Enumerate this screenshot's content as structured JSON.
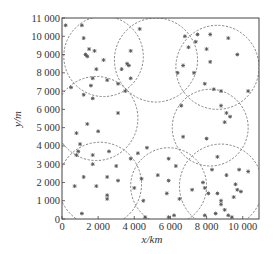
{
  "chart_data": {
    "type": "scatter",
    "title": "",
    "xlabel": "x/km",
    "ylabel": "y/m",
    "xlim": [
      0,
      10900
    ],
    "ylim": [
      0,
      11000
    ],
    "grid": false,
    "legend": null,
    "x_ticks": [
      0,
      2000,
      4000,
      6000,
      8000,
      10000
    ],
    "x_tick_labels": [
      "0",
      "2 000",
      "4 000",
      "6 000",
      "8 000",
      "10 000"
    ],
    "y_ticks": [
      0,
      1000,
      2000,
      3000,
      4000,
      5000,
      6000,
      7000,
      8000,
      9000,
      10000,
      11000
    ],
    "y_tick_labels": [
      "0",
      "1 000",
      "2 000",
      "3 000",
      "4 000",
      "5 000",
      "6 000",
      "7 000",
      "8 000",
      "9 000",
      "10 000",
      "11 000"
    ],
    "marker": "*",
    "marker_color": "#555555",
    "circle_style": "dashed",
    "circle_color": "#777777",
    "circles": [
      {
        "cx": 2300,
        "cy": 8900,
        "r": 2200
      },
      {
        "cx": 5200,
        "cy": 8700,
        "r": 2300
      },
      {
        "cx": 8600,
        "cy": 8300,
        "r": 2300
      },
      {
        "cx": 1900,
        "cy": 5500,
        "r": 2300
      },
      {
        "cx": 8200,
        "cy": 5000,
        "r": 2100
      },
      {
        "cx": 2100,
        "cy": 1900,
        "r": 2300
      },
      {
        "cx": 5900,
        "cy": 1800,
        "r": 2100
      },
      {
        "cx": 8800,
        "cy": 1800,
        "r": 2300
      }
    ],
    "points": [
      {
        "x": 200,
        "y": 10600
      },
      {
        "x": 1100,
        "y": 10600
      },
      {
        "x": 1200,
        "y": 9900
      },
      {
        "x": 1500,
        "y": 9300
      },
      {
        "x": 1300,
        "y": 9000
      },
      {
        "x": 1400,
        "y": 8900
      },
      {
        "x": 1800,
        "y": 9200
      },
      {
        "x": 2300,
        "y": 8700
      },
      {
        "x": 1900,
        "y": 8200
      },
      {
        "x": 1700,
        "y": 7700
      },
      {
        "x": 2500,
        "y": 7600
      },
      {
        "x": 1600,
        "y": 7300
      },
      {
        "x": 500,
        "y": 7200
      },
      {
        "x": 1200,
        "y": 6800
      },
      {
        "x": 1700,
        "y": 6600
      },
      {
        "x": 4300,
        "y": 10400
      },
      {
        "x": 3800,
        "y": 9200
      },
      {
        "x": 3600,
        "y": 8500
      },
      {
        "x": 3700,
        "y": 8400
      },
      {
        "x": 3300,
        "y": 8200
      },
      {
        "x": 3800,
        "y": 7700
      },
      {
        "x": 3100,
        "y": 7400
      },
      {
        "x": 3500,
        "y": 7000
      },
      {
        "x": 6400,
        "y": 8000
      },
      {
        "x": 6700,
        "y": 8400
      },
      {
        "x": 6800,
        "y": 10000
      },
      {
        "x": 7000,
        "y": 9400
      },
      {
        "x": 7400,
        "y": 9700
      },
      {
        "x": 7500,
        "y": 10100
      },
      {
        "x": 8000,
        "y": 9300
      },
      {
        "x": 8200,
        "y": 8600
      },
      {
        "x": 7300,
        "y": 8000
      },
      {
        "x": 7900,
        "y": 7400
      },
      {
        "x": 8400,
        "y": 7100
      },
      {
        "x": 8800,
        "y": 7000
      },
      {
        "x": 8200,
        "y": 10100
      },
      {
        "x": 9200,
        "y": 9900
      },
      {
        "x": 9700,
        "y": 9000
      },
      {
        "x": 10300,
        "y": 7000
      },
      {
        "x": 6600,
        "y": 6200
      },
      {
        "x": 8800,
        "y": 6200
      },
      {
        "x": 9100,
        "y": 5800
      },
      {
        "x": 9300,
        "y": 5600
      },
      {
        "x": 9000,
        "y": 5300
      },
      {
        "x": 1400,
        "y": 5200
      },
      {
        "x": 800,
        "y": 4700
      },
      {
        "x": 2000,
        "y": 4800
      },
      {
        "x": 1700,
        "y": 3500
      },
      {
        "x": 1700,
        "y": 3000
      },
      {
        "x": 3100,
        "y": 5800
      },
      {
        "x": 900,
        "y": 3700
      },
      {
        "x": 1000,
        "y": 4100
      },
      {
        "x": 800,
        "y": 3500
      },
      {
        "x": 1200,
        "y": 2300
      },
      {
        "x": 700,
        "y": 1800
      },
      {
        "x": 2600,
        "y": 3700
      },
      {
        "x": 1900,
        "y": 1800
      },
      {
        "x": 2500,
        "y": 2300
      },
      {
        "x": 3000,
        "y": 2900
      },
      {
        "x": 3100,
        "y": 2100
      },
      {
        "x": 2500,
        "y": 1300
      },
      {
        "x": 2500,
        "y": 1100
      },
      {
        "x": 3800,
        "y": 3300
      },
      {
        "x": 4400,
        "y": 2200
      },
      {
        "x": 1100,
        "y": 300
      },
      {
        "x": 4000,
        "y": 1700
      },
      {
        "x": 4500,
        "y": 1000
      },
      {
        "x": 4600,
        "y": 100
      },
      {
        "x": 4200,
        "y": 3600
      },
      {
        "x": 4700,
        "y": 3900
      },
      {
        "x": 5300,
        "y": 2400
      },
      {
        "x": 5900,
        "y": 3300
      },
      {
        "x": 5900,
        "y": 2100
      },
      {
        "x": 5800,
        "y": 1400
      },
      {
        "x": 6300,
        "y": 2900
      },
      {
        "x": 6500,
        "y": 1100
      },
      {
        "x": 6200,
        "y": 200
      },
      {
        "x": 5900,
        "y": 100
      },
      {
        "x": 6700,
        "y": 4500
      },
      {
        "x": 8000,
        "y": 4400
      },
      {
        "x": 8600,
        "y": 3400
      },
      {
        "x": 8300,
        "y": 2700
      },
      {
        "x": 9100,
        "y": 2400
      },
      {
        "x": 7800,
        "y": 2000
      },
      {
        "x": 7900,
        "y": 1700
      },
      {
        "x": 8100,
        "y": 1400
      },
      {
        "x": 8600,
        "y": 1400
      },
      {
        "x": 8800,
        "y": 1000
      },
      {
        "x": 8800,
        "y": 800
      },
      {
        "x": 8500,
        "y": 300
      },
      {
        "x": 9000,
        "y": 500
      },
      {
        "x": 9500,
        "y": 1200
      },
      {
        "x": 9800,
        "y": 2700
      },
      {
        "x": 10300,
        "y": 2600
      },
      {
        "x": 9600,
        "y": 1900
      },
      {
        "x": 9700,
        "y": 1600
      },
      {
        "x": 9900,
        "y": 1500
      },
      {
        "x": 9200,
        "y": 200
      },
      {
        "x": 9400,
        "y": 100
      },
      {
        "x": 7200,
        "y": 1600
      },
      {
        "x": 7900,
        "y": 200
      }
    ]
  }
}
